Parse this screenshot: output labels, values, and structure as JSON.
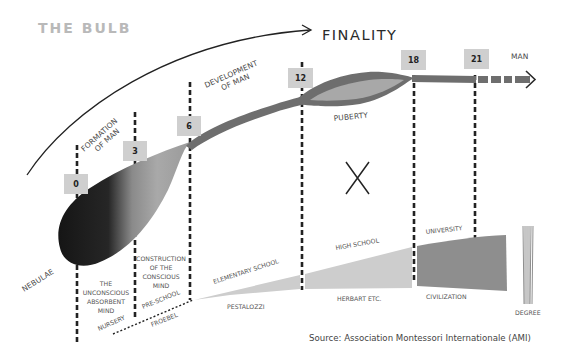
{
  "title": "THE BULB",
  "finality_label": "FINALITY",
  "end_label": "MAN",
  "stage_labels": {
    "formation_line1": "FORMATION",
    "formation_line2": "OF MAN",
    "development_line1": "DEVELOPMENT",
    "development_line2": "OF MAN",
    "puberty": "PUBERTY",
    "nebulae": "NEBULAE",
    "x_mark": "X"
  },
  "ages": [
    {
      "label": "0"
    },
    {
      "label": "3"
    },
    {
      "label": "6"
    },
    {
      "label": "12"
    },
    {
      "label": "18"
    },
    {
      "label": "21"
    }
  ],
  "mind_labels": {
    "unconscious": [
      "THE",
      "UNCONSCIOUS",
      "ABSORBENT",
      "MIND"
    ],
    "conscious": [
      "CONSTRUCTION",
      "OF THE",
      "CONSCIOUS",
      "MIND"
    ]
  },
  "education": {
    "nursery": "NURSERY",
    "pre_school": "PRE-SCHOOL",
    "froebel": "FROEBEL",
    "elementary_school": "ELEMENTARY SCHOOL",
    "pestalozzi": "PESTALOZZI",
    "high_school": "HIGH SCHOOL",
    "herbart": "HERBART ETC.",
    "university": "UNIVERSITY",
    "civilization": "CIVILIZATION",
    "degree": "DEGREE"
  },
  "source": "Source: Association Montessori Internationale (AMI)",
  "colors": {
    "title_gray": "#b9b9b9",
    "band_gray": "#6e6e6e",
    "puberty_fill": "#a8a8a8",
    "bulb_dark": "#1e1e1e",
    "bulb_light": "#b4b4b4",
    "school_light": "#cdcdcd",
    "university_dark": "#8e8e8e",
    "age_box": "#cfcfcf"
  }
}
